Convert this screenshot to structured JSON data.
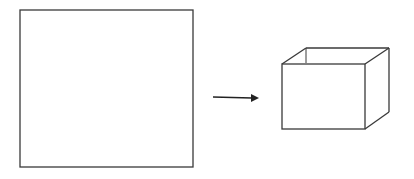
{
  "diagram": {
    "colors": {
      "stroke": "#3a3a3a",
      "background": "#ffffff"
    },
    "square": {
      "x": 20,
      "y": 10,
      "w": 173,
      "h": 157
    },
    "arrow": {
      "x1": 213,
      "y1": 97,
      "x2": 259,
      "y2": 98
    },
    "box": {
      "front": {
        "x": 282,
        "y": 64,
        "w": 83,
        "h": 65
      },
      "depth": {
        "dx": 24,
        "dy": -16
      }
    }
  }
}
